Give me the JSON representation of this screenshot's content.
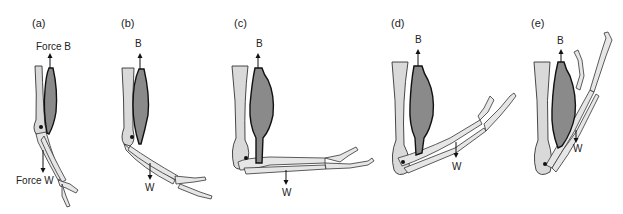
{
  "figure": {
    "panels": [
      {
        "id": "a",
        "label": "(a)",
        "force_up": "Force B",
        "force_down": "Force W"
      },
      {
        "id": "b",
        "label": "(b)",
        "force_up": "B",
        "force_down": "W"
      },
      {
        "id": "c",
        "label": "(c)",
        "force_up": "B",
        "force_down": "W"
      },
      {
        "id": "d",
        "label": "(d)",
        "force_up": "B",
        "force_down": "W"
      },
      {
        "id": "e",
        "label": "(e)",
        "force_up": "B",
        "force_down": "W"
      }
    ],
    "colors": {
      "bone": "#d9d9d9",
      "muscle": "#8a8a8a",
      "outline": "#111111",
      "background": "#ffffff"
    }
  }
}
